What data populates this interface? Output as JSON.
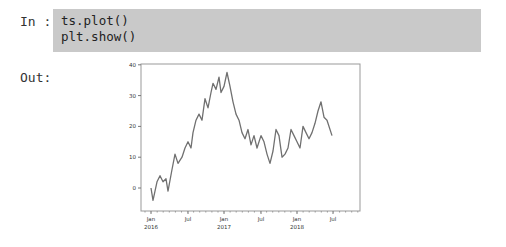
{
  "cell": {
    "in_prompt": "In :",
    "out_prompt": "Out:",
    "code_lines": [
      "ts.plot()",
      "plt.show()"
    ]
  },
  "colors": {
    "code_background": "#c9c9c9",
    "line": "#707070",
    "axes": "#888888"
  },
  "chart_data": {
    "type": "line",
    "title": "",
    "xlabel": "",
    "ylabel": "",
    "ylim": [
      -7.5,
      40
    ],
    "yticks": [
      0,
      10,
      20,
      30,
      40
    ],
    "xtick_labels": [
      {
        "label": "Jan",
        "sublabel": "2016"
      },
      {
        "label": "Jul",
        "sublabel": ""
      },
      {
        "label": "Jan",
        "sublabel": "2017"
      },
      {
        "label": "Jul",
        "sublabel": ""
      },
      {
        "label": "Jan",
        "sublabel": "2018"
      },
      {
        "label": "Jul",
        "sublabel": ""
      }
    ],
    "grid": false,
    "legend": false,
    "x": [
      "2016-01",
      "2016-01",
      "2016-02",
      "2016-02",
      "2016-03",
      "2016-03",
      "2016-04",
      "2016-04",
      "2016-05",
      "2016-06",
      "2016-06",
      "2016-07",
      "2016-07",
      "2016-08",
      "2016-08",
      "2016-09",
      "2016-09",
      "2016-10",
      "2016-10",
      "2016-11",
      "2016-11",
      "2016-12",
      "2016-12",
      "2017-01",
      "2017-01",
      "2017-02",
      "2017-02",
      "2017-03",
      "2017-03",
      "2017-04",
      "2017-04",
      "2017-05",
      "2017-05",
      "2017-06",
      "2017-06",
      "2017-07",
      "2017-07",
      "2017-08",
      "2017-08",
      "2017-09",
      "2017-09",
      "2017-10",
      "2017-10",
      "2017-11",
      "2017-11",
      "2017-12",
      "2017-12",
      "2018-01",
      "2018-01",
      "2018-02",
      "2018-02",
      "2018-03",
      "2018-03",
      "2018-04",
      "2018-04",
      "2018-05",
      "2018-05",
      "2018-06",
      "2018-06",
      "2018-07",
      "2018-08"
    ],
    "values": [
      0,
      -4,
      2,
      4,
      2,
      3,
      -1,
      6,
      11,
      8,
      10,
      13,
      15,
      13,
      18,
      22,
      24,
      22,
      29,
      26,
      31,
      34,
      32,
      36,
      31,
      33,
      37.5,
      33,
      28,
      24,
      22,
      18,
      16,
      19,
      14,
      17,
      13,
      17,
      15,
      11,
      8,
      12,
      19,
      17,
      10,
      11,
      13,
      19,
      17,
      15,
      13,
      20,
      18,
      16,
      18,
      21,
      25,
      28,
      23,
      22,
      17
    ],
    "px_x": [
      151,
      153,
      157,
      160,
      163,
      166,
      168,
      172,
      175,
      178,
      182,
      185,
      188,
      191,
      193,
      196,
      199,
      202,
      205,
      208,
      211,
      213,
      216,
      219,
      221,
      224,
      227,
      230,
      233,
      236,
      239,
      242,
      245,
      248,
      251,
      254,
      257,
      261,
      264,
      267,
      270,
      273,
      276,
      279,
      282,
      285,
      288,
      291,
      294,
      297,
      300,
      303,
      306,
      309,
      312,
      315,
      318,
      321,
      324,
      327,
      332
    ]
  }
}
